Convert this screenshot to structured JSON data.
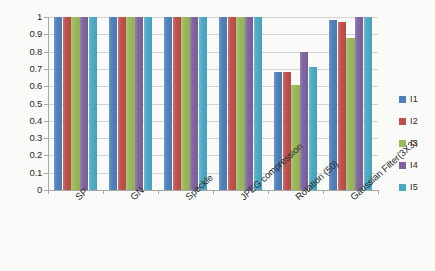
{
  "chart_data": {
    "type": "bar",
    "title": "",
    "subtitle": "",
    "xlabel": "",
    "ylabel": "",
    "ylim": [
      0,
      1
    ],
    "ytick_labels": [
      "1",
      "0.9",
      "0.8",
      "0.7",
      "0.6",
      "0.5",
      "0.4",
      "0.3",
      "0.2",
      "0.1",
      "0"
    ],
    "ytick_values": [
      1,
      0.9,
      0.8,
      0.7,
      0.6,
      0.5,
      0.4,
      0.3,
      0.2,
      0.1,
      0
    ],
    "grid": true,
    "legend_position": "right",
    "categories": [
      "SP",
      "GN",
      "Speckle",
      "JPEG compression",
      "Rotation (50)",
      "Gaussian Filter(3X3)"
    ],
    "series": [
      {
        "name": "I1",
        "color": "#4F81BD",
        "values": [
          1,
          1,
          1,
          1,
          0.68,
          0.98
        ]
      },
      {
        "name": "I2",
        "color": "#C0504D",
        "values": [
          1,
          1,
          1,
          1,
          0.685,
          0.97
        ]
      },
      {
        "name": "I3",
        "color": "#9BBB59",
        "values": [
          1,
          1,
          1,
          1,
          0.605,
          0.88
        ]
      },
      {
        "name": "I4",
        "color": "#8064A2",
        "values": [
          1,
          1,
          1,
          1,
          0.8,
          1
        ]
      },
      {
        "name": "I5",
        "color": "#4BACC6",
        "values": [
          1,
          1,
          1,
          1,
          0.71,
          1
        ]
      }
    ]
  }
}
